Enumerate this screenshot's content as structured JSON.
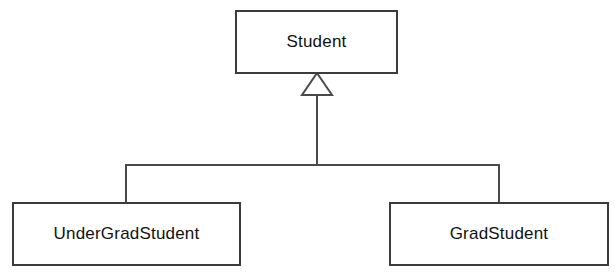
{
  "diagram": {
    "type": "uml-class-diagram",
    "background_color": "#ffffff",
    "line_color": "#4a4a4a",
    "box_border_color": "#3c3c3c",
    "box_fill_color": "#ffffff",
    "text_color": "#111111",
    "classes": [
      {
        "id": "student",
        "label": "Student",
        "role": "superclass",
        "x": 236,
        "y": 11,
        "width": 161,
        "height": 62
      },
      {
        "id": "undergradstudent",
        "label": "UnderGradStudent",
        "role": "subclass",
        "x": 13,
        "y": 203,
        "width": 227,
        "height": 62
      },
      {
        "id": "gradstudent",
        "label": "GradStudent",
        "role": "subclass",
        "x": 390,
        "y": 203,
        "width": 218,
        "height": 62
      }
    ],
    "relationships": [
      {
        "id": "undergrad-inherits-student",
        "kind": "generalization",
        "from": "undergradstudent",
        "to": "student",
        "arrow": "hollow-triangle"
      },
      {
        "id": "grad-inherits-student",
        "kind": "generalization",
        "from": "gradstudent",
        "to": "student",
        "arrow": "hollow-triangle"
      }
    ],
    "connector_geometry": {
      "triangle_apex_x": 317,
      "triangle_apex_y": 73,
      "triangle_base_y": 95,
      "triangle_left_x": 302,
      "triangle_right_x": 332,
      "stem_x": 317,
      "stem_top_y": 95,
      "bus_y": 165,
      "bus_left_x": 126,
      "bus_right_x": 499,
      "drop_bottom_y": 203
    }
  }
}
